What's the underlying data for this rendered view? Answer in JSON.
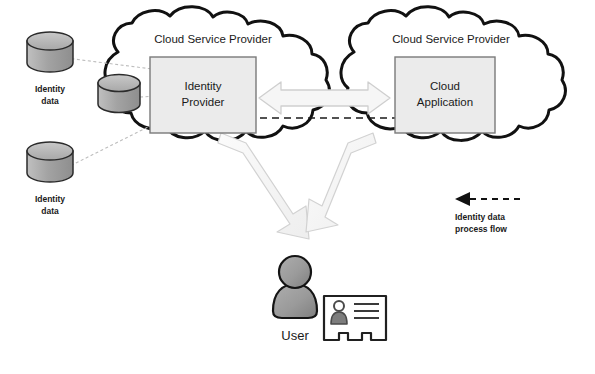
{
  "diagram": {
    "clouds": [
      {
        "id": "left",
        "label": "Cloud Service Provider"
      },
      {
        "id": "right",
        "label": "Cloud Service Provider"
      }
    ],
    "boxes": [
      {
        "id": "identity-provider",
        "line1": "Identity",
        "line2": "Provider"
      },
      {
        "id": "cloud-application",
        "line1": "Cloud",
        "line2": "Application"
      }
    ],
    "datastores": [
      {
        "id": "db-top-left",
        "line1": "Identity",
        "line2": "data"
      },
      {
        "id": "db-inner",
        "line1": "",
        "line2": ""
      },
      {
        "id": "db-bottom-left",
        "line1": "Identity",
        "line2": "data"
      }
    ],
    "actor": {
      "label": "User",
      "badge_name": "id-card"
    },
    "legend": {
      "line1": "Identity data",
      "line2": "process flow",
      "arrow_direction": "left"
    },
    "colors": {
      "outline": "#111111",
      "box_fill": "#ebebeb",
      "box_stroke": "#6b6b6b",
      "arrow_fill": "#f4f4f4",
      "arrow_stroke": "#c8c8c8",
      "db_fill_top": "#b4b4b4",
      "db_fill_body": "#9c9c9c",
      "person_fill": "#9a9a9a",
      "text": "#1a1a1a",
      "connector": "#b9b9b9",
      "background": "#ffffff"
    }
  }
}
